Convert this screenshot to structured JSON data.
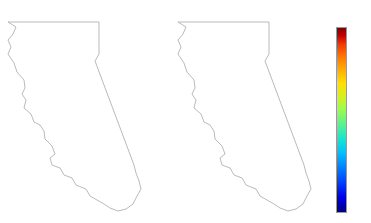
{
  "figure": {
    "background_color": "#ffffff",
    "outline_color": "#a8a8a8",
    "marker_edge_color": "#ffffff"
  },
  "panels": [
    {
      "id": "b1",
      "title": "B1"
    },
    {
      "id": "a2",
      "title": "A2"
    }
  ],
  "colorbar": {
    "name": "jet",
    "orientation": "vertical",
    "vmin": 0.0,
    "vmax": 1.0,
    "ticks": [
      "1.0",
      "0.8",
      "0.6",
      "0.4",
      "0.2",
      "0.0"
    ],
    "tick_values": [
      1.0,
      0.8,
      0.6,
      0.4,
      0.2,
      0.0
    ],
    "stops": [
      {
        "pos": 0.0,
        "color": "#00007f"
      },
      {
        "pos": 0.125,
        "color": "#0000e8"
      },
      {
        "pos": 0.25,
        "color": "#0080ff"
      },
      {
        "pos": 0.375,
        "color": "#1ae5d0"
      },
      {
        "pos": 0.5,
        "color": "#5cf18f"
      },
      {
        "pos": 0.625,
        "color": "#d6f021"
      },
      {
        "pos": 0.75,
        "color": "#ffb000"
      },
      {
        "pos": 0.875,
        "color": "#f23c00"
      },
      {
        "pos": 1.0,
        "color": "#7f0000"
      }
    ]
  },
  "chart_data": {
    "type": "scatter",
    "title": "",
    "xlabel": "",
    "ylabel": "",
    "colormap": "jet",
    "colorbar_label": "",
    "clim": [
      0.0,
      1.0
    ],
    "grid": false,
    "legend": "none",
    "panel_count": 2,
    "series": [
      {
        "name": "B1",
        "marker": "circle",
        "points": [
          {
            "x": 14,
            "y": 12,
            "v": 0.06
          },
          {
            "x": 46,
            "y": 13,
            "v": 0.87
          },
          {
            "x": 81,
            "y": 12,
            "v": 0.88
          },
          {
            "x": 12,
            "y": 31,
            "v": 0.05
          },
          {
            "x": 35,
            "y": 30,
            "v": 0.85
          },
          {
            "x": 53,
            "y": 30,
            "v": 0.86
          },
          {
            "x": 84,
            "y": 31,
            "v": 0.86
          },
          {
            "x": 58,
            "y": 42,
            "v": 0.66
          },
          {
            "x": 79,
            "y": 41,
            "v": 0.9
          },
          {
            "x": 81,
            "y": 48,
            "v": 0.85
          },
          {
            "x": 27,
            "y": 52,
            "v": 0.66
          },
          {
            "x": 50,
            "y": 50,
            "v": 0.63
          },
          {
            "x": 70,
            "y": 51,
            "v": 0.86
          },
          {
            "x": 43,
            "y": 58,
            "v": 0.63
          },
          {
            "x": 56,
            "y": 58,
            "v": 0.58
          },
          {
            "x": 83,
            "y": 56,
            "v": 0.93
          },
          {
            "x": 88,
            "y": 59,
            "v": 0.92
          },
          {
            "x": 31,
            "y": 63,
            "v": 0.46
          },
          {
            "x": 45,
            "y": 64,
            "v": 0.62
          },
          {
            "x": 54,
            "y": 64,
            "v": 0.55
          },
          {
            "x": 66,
            "y": 63,
            "v": 0.82
          },
          {
            "x": 86,
            "y": 64,
            "v": 0.9
          },
          {
            "x": 37,
            "y": 68,
            "v": 0.44
          },
          {
            "x": 47,
            "y": 69,
            "v": 0.57
          },
          {
            "x": 61,
            "y": 69,
            "v": 0.53
          },
          {
            "x": 84,
            "y": 69,
            "v": 0.91
          },
          {
            "x": 24,
            "y": 73,
            "v": 0.44
          },
          {
            "x": 32,
            "y": 74,
            "v": 0.16
          },
          {
            "x": 41,
            "y": 74,
            "v": 0.6
          },
          {
            "x": 52,
            "y": 74,
            "v": 0.5
          },
          {
            "x": 70,
            "y": 73,
            "v": 0.88
          },
          {
            "x": 85,
            "y": 75,
            "v": 0.92
          },
          {
            "x": 29,
            "y": 79,
            "v": 0.13
          },
          {
            "x": 36,
            "y": 80,
            "v": 0.59
          },
          {
            "x": 48,
            "y": 81,
            "v": 0.49
          },
          {
            "x": 63,
            "y": 80,
            "v": 0.87
          },
          {
            "x": 80,
            "y": 81,
            "v": 0.89
          },
          {
            "x": 24,
            "y": 84,
            "v": 0.07
          },
          {
            "x": 33,
            "y": 86,
            "v": 0.55
          },
          {
            "x": 45,
            "y": 87,
            "v": 0.47
          },
          {
            "x": 58,
            "y": 86,
            "v": 0.86
          },
          {
            "x": 100,
            "y": 84,
            "v": 0.86
          },
          {
            "x": 27,
            "y": 90,
            "v": 0.06
          },
          {
            "x": 38,
            "y": 91,
            "v": 0.48
          },
          {
            "x": 52,
            "y": 92,
            "v": 0.84
          },
          {
            "x": 81,
            "y": 92,
            "v": 0.85
          },
          {
            "x": 22,
            "y": 95,
            "v": 0.05
          },
          {
            "x": 33,
            "y": 96,
            "v": 0.5
          },
          {
            "x": 46,
            "y": 97,
            "v": 0.83
          },
          {
            "x": 69,
            "y": 97,
            "v": 0.85
          },
          {
            "x": 31,
            "y": 102,
            "v": 0.2
          },
          {
            "x": 43,
            "y": 102,
            "v": 0.49
          },
          {
            "x": 57,
            "y": 101,
            "v": 0.84
          },
          {
            "x": 37,
            "y": 108,
            "v": 0.19
          },
          {
            "x": 50,
            "y": 109,
            "v": 0.46
          },
          {
            "x": 62,
            "y": 110,
            "v": 0.62
          },
          {
            "x": 45,
            "y": 115,
            "v": 0.78
          },
          {
            "x": 58,
            "y": 116,
            "v": 0.47
          },
          {
            "x": 73,
            "y": 115,
            "v": 0.63
          },
          {
            "x": 88,
            "y": 114,
            "v": 0.8
          },
          {
            "x": 44,
            "y": 122,
            "v": 0.74
          },
          {
            "x": 60,
            "y": 123,
            "v": 0.46
          },
          {
            "x": 78,
            "y": 122,
            "v": 0.62
          },
          {
            "x": 122,
            "y": 120,
            "v": 0.86
          },
          {
            "x": 47,
            "y": 131,
            "v": 0.66
          },
          {
            "x": 66,
            "y": 132,
            "v": 0.62
          },
          {
            "x": 84,
            "y": 131,
            "v": 0.63
          },
          {
            "x": 55,
            "y": 142,
            "v": 0.25
          },
          {
            "x": 74,
            "y": 143,
            "v": 0.63
          },
          {
            "x": 64,
            "y": 152,
            "v": 0.45
          },
          {
            "x": 83,
            "y": 153,
            "v": 0.63
          },
          {
            "x": 129,
            "y": 150,
            "v": 0.86
          },
          {
            "x": 74,
            "y": 161,
            "v": 0.44
          },
          {
            "x": 92,
            "y": 162,
            "v": 0.61
          },
          {
            "x": 125,
            "y": 166,
            "v": 0.85
          },
          {
            "x": 86,
            "y": 170,
            "v": 0.43
          },
          {
            "x": 104,
            "y": 169,
            "v": 0.24
          },
          {
            "x": 99,
            "y": 179,
            "v": 0.85
          },
          {
            "x": 121,
            "y": 180,
            "v": 0.86
          }
        ]
      },
      {
        "name": "A2",
        "marker": "circle",
        "points": [
          {
            "x": 14,
            "y": 12,
            "v": 0.08
          },
          {
            "x": 46,
            "y": 13,
            "v": 0.88
          },
          {
            "x": 81,
            "y": 12,
            "v": 0.88
          },
          {
            "x": 12,
            "y": 31,
            "v": 0.22
          },
          {
            "x": 35,
            "y": 30,
            "v": 0.86
          },
          {
            "x": 53,
            "y": 30,
            "v": 0.86
          },
          {
            "x": 84,
            "y": 31,
            "v": 0.87
          },
          {
            "x": 58,
            "y": 42,
            "v": 0.8
          },
          {
            "x": 79,
            "y": 41,
            "v": 0.91
          },
          {
            "x": 81,
            "y": 48,
            "v": 0.87
          },
          {
            "x": 27,
            "y": 52,
            "v": 0.73
          },
          {
            "x": 50,
            "y": 50,
            "v": 0.79
          },
          {
            "x": 70,
            "y": 51,
            "v": 0.88
          },
          {
            "x": 43,
            "y": 58,
            "v": 0.76
          },
          {
            "x": 56,
            "y": 58,
            "v": 0.78
          },
          {
            "x": 83,
            "y": 56,
            "v": 0.94
          },
          {
            "x": 88,
            "y": 59,
            "v": 0.93
          },
          {
            "x": 31,
            "y": 63,
            "v": 0.49
          },
          {
            "x": 45,
            "y": 64,
            "v": 0.75
          },
          {
            "x": 54,
            "y": 64,
            "v": 0.7
          },
          {
            "x": 66,
            "y": 63,
            "v": 0.86
          },
          {
            "x": 86,
            "y": 64,
            "v": 0.91
          },
          {
            "x": 37,
            "y": 68,
            "v": 0.47
          },
          {
            "x": 47,
            "y": 69,
            "v": 0.66
          },
          {
            "x": 61,
            "y": 69,
            "v": 0.64
          },
          {
            "x": 84,
            "y": 69,
            "v": 0.92
          },
          {
            "x": 24,
            "y": 73,
            "v": 0.45
          },
          {
            "x": 32,
            "y": 74,
            "v": 0.22
          },
          {
            "x": 41,
            "y": 74,
            "v": 0.68
          },
          {
            "x": 52,
            "y": 74,
            "v": 0.62
          },
          {
            "x": 70,
            "y": 73,
            "v": 0.89
          },
          {
            "x": 85,
            "y": 75,
            "v": 0.93
          },
          {
            "x": 29,
            "y": 79,
            "v": 0.17
          },
          {
            "x": 36,
            "y": 80,
            "v": 0.66
          },
          {
            "x": 48,
            "y": 81,
            "v": 0.61
          },
          {
            "x": 63,
            "y": 80,
            "v": 0.88
          },
          {
            "x": 80,
            "y": 81,
            "v": 0.9
          },
          {
            "x": 24,
            "y": 84,
            "v": 0.1
          },
          {
            "x": 33,
            "y": 86,
            "v": 0.62
          },
          {
            "x": 45,
            "y": 87,
            "v": 0.6
          },
          {
            "x": 58,
            "y": 86,
            "v": 0.87
          },
          {
            "x": 100,
            "y": 84,
            "v": 0.87
          },
          {
            "x": 27,
            "y": 90,
            "v": 0.09
          },
          {
            "x": 38,
            "y": 91,
            "v": 0.58
          },
          {
            "x": 52,
            "y": 92,
            "v": 0.85
          },
          {
            "x": 81,
            "y": 92,
            "v": 0.86
          },
          {
            "x": 22,
            "y": 95,
            "v": 0.42
          },
          {
            "x": 33,
            "y": 96,
            "v": 0.6
          },
          {
            "x": 46,
            "y": 97,
            "v": 0.84
          },
          {
            "x": 69,
            "y": 97,
            "v": 0.86
          },
          {
            "x": 31,
            "y": 102,
            "v": 0.43
          },
          {
            "x": 43,
            "y": 102,
            "v": 0.61
          },
          {
            "x": 57,
            "y": 101,
            "v": 0.85
          },
          {
            "x": 37,
            "y": 108,
            "v": 0.44
          },
          {
            "x": 50,
            "y": 109,
            "v": 0.6
          },
          {
            "x": 62,
            "y": 110,
            "v": 0.74
          },
          {
            "x": 45,
            "y": 115,
            "v": 0.83
          },
          {
            "x": 58,
            "y": 116,
            "v": 0.62
          },
          {
            "x": 73,
            "y": 115,
            "v": 0.76
          },
          {
            "x": 88,
            "y": 114,
            "v": 0.84
          },
          {
            "x": 44,
            "y": 122,
            "v": 0.82
          },
          {
            "x": 60,
            "y": 123,
            "v": 0.61
          },
          {
            "x": 78,
            "y": 122,
            "v": 0.75
          },
          {
            "x": 122,
            "y": 120,
            "v": 0.87
          },
          {
            "x": 47,
            "y": 131,
            "v": 0.79
          },
          {
            "x": 66,
            "y": 132,
            "v": 0.74
          },
          {
            "x": 84,
            "y": 131,
            "v": 0.76
          },
          {
            "x": 55,
            "y": 142,
            "v": 0.45
          },
          {
            "x": 74,
            "y": 143,
            "v": 0.8
          },
          {
            "x": 64,
            "y": 152,
            "v": 0.59
          },
          {
            "x": 83,
            "y": 153,
            "v": 0.76
          },
          {
            "x": 129,
            "y": 150,
            "v": 0.87
          },
          {
            "x": 74,
            "y": 161,
            "v": 0.57
          },
          {
            "x": 92,
            "y": 162,
            "v": 0.74
          },
          {
            "x": 125,
            "y": 166,
            "v": 0.86
          },
          {
            "x": 86,
            "y": 170,
            "v": 0.55
          },
          {
            "x": 104,
            "y": 169,
            "v": 0.43
          },
          {
            "x": 99,
            "y": 179,
            "v": 0.86
          },
          {
            "x": 121,
            "y": 180,
            "v": 0.87
          }
        ]
      }
    ]
  }
}
